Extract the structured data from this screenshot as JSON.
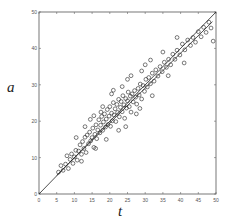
{
  "chart_data": {
    "type": "scatter",
    "title": "",
    "xlabel": "t",
    "ylabel": "a",
    "xlim": [
      0,
      50
    ],
    "ylim": [
      0,
      50
    ],
    "xticks": [
      0,
      5,
      10,
      15,
      20,
      25,
      30,
      35,
      40,
      45,
      50
    ],
    "yticks": [
      0,
      10,
      20,
      30,
      40,
      50
    ],
    "grid": false,
    "legend": null,
    "marker": "open-circle",
    "lines": [
      {
        "name": "identity",
        "slope": 1.0,
        "intercept": 0.0,
        "x": [
          0,
          50
        ]
      },
      {
        "name": "fit",
        "slope": 0.96,
        "intercept": 0.3,
        "x": [
          5,
          49
        ]
      }
    ],
    "series": [
      {
        "name": "samples",
        "points": [
          [
            5.5,
            6.0
          ],
          [
            6.2,
            7.8
          ],
          [
            6.8,
            6.5
          ],
          [
            7.5,
            8.2
          ],
          [
            7.9,
            10.5
          ],
          [
            8.3,
            7.0
          ],
          [
            8.8,
            9.5
          ],
          [
            9.2,
            11.0
          ],
          [
            9.6,
            8.4
          ],
          [
            10.0,
            10.2
          ],
          [
            10.4,
            12.0
          ],
          [
            10.8,
            9.3
          ],
          [
            11.2,
            11.8
          ],
          [
            11.6,
            13.5
          ],
          [
            12.0,
            10.9
          ],
          [
            12.3,
            14.4
          ],
          [
            12.7,
            12.5
          ],
          [
            13.0,
            15.6
          ],
          [
            13.3,
            11.4
          ],
          [
            13.6,
            16.2
          ],
          [
            14.0,
            13.8
          ],
          [
            14.3,
            17.0
          ],
          [
            14.6,
            14.6
          ],
          [
            15.0,
            15.5
          ],
          [
            15.2,
            18.1
          ],
          [
            15.5,
            12.8
          ],
          [
            15.8,
            16.4
          ],
          [
            16.1,
            19.0
          ],
          [
            16.3,
            15.2
          ],
          [
            16.6,
            17.6
          ],
          [
            16.9,
            20.4
          ],
          [
            17.2,
            16.8
          ],
          [
            17.4,
            18.9
          ],
          [
            17.7,
            21.3
          ],
          [
            18.0,
            17.5
          ],
          [
            18.2,
            19.8
          ],
          [
            18.5,
            22.0
          ],
          [
            18.8,
            18.4
          ],
          [
            19.0,
            20.6
          ],
          [
            19.3,
            23.2
          ],
          [
            19.5,
            19.1
          ],
          [
            19.8,
            21.4
          ],
          [
            20.0,
            24.0
          ],
          [
            20.2,
            18.6
          ],
          [
            20.5,
            22.2
          ],
          [
            20.7,
            20.1
          ],
          [
            21.0,
            25.1
          ],
          [
            21.2,
            21.7
          ],
          [
            21.5,
            23.4
          ],
          [
            21.7,
            19.9
          ],
          [
            22.0,
            24.6
          ],
          [
            22.2,
            22.4
          ],
          [
            22.5,
            26.0
          ],
          [
            22.7,
            21.2
          ],
          [
            23.0,
            23.8
          ],
          [
            23.2,
            25.4
          ],
          [
            23.5,
            22.6
          ],
          [
            23.7,
            27.0
          ],
          [
            24.0,
            24.5
          ],
          [
            24.2,
            20.8
          ],
          [
            24.5,
            26.2
          ],
          [
            24.7,
            23.6
          ],
          [
            25.0,
            25.6
          ],
          [
            25.2,
            28.0
          ],
          [
            25.5,
            24.0
          ],
          [
            25.8,
            26.9
          ],
          [
            26.0,
            22.5
          ],
          [
            26.3,
            27.5
          ],
          [
            26.6,
            25.3
          ],
          [
            27.0,
            28.4
          ],
          [
            27.3,
            26.6
          ],
          [
            27.6,
            24.7
          ],
          [
            28.0,
            29.0
          ],
          [
            28.3,
            27.2
          ],
          [
            28.6,
            30.2
          ],
          [
            29.0,
            26.1
          ],
          [
            29.4,
            29.8
          ],
          [
            29.8,
            28.2
          ],
          [
            30.2,
            31.5
          ],
          [
            30.6,
            29.4
          ],
          [
            31.0,
            32.0
          ],
          [
            31.5,
            30.3
          ],
          [
            32.0,
            33.2
          ],
          [
            32.5,
            31.0
          ],
          [
            33.0,
            34.1
          ],
          [
            33.6,
            32.4
          ],
          [
            34.2,
            35.0
          ],
          [
            34.8,
            33.6
          ],
          [
            35.4,
            36.2
          ],
          [
            36.0,
            34.8
          ],
          [
            36.6,
            37.0
          ],
          [
            37.2,
            35.5
          ],
          [
            37.8,
            38.4
          ],
          [
            38.4,
            37.0
          ],
          [
            39.0,
            39.5
          ],
          [
            39.8,
            38.2
          ],
          [
            40.5,
            41.2
          ],
          [
            41.2,
            39.6
          ],
          [
            42.0,
            42.3
          ],
          [
            42.8,
            40.8
          ],
          [
            43.5,
            43.0
          ],
          [
            44.2,
            41.7
          ],
          [
            45.0,
            44.6
          ],
          [
            45.8,
            43.2
          ],
          [
            46.5,
            45.8
          ],
          [
            47.2,
            44.4
          ],
          [
            48.0,
            47.2
          ],
          [
            48.6,
            45.6
          ],
          [
            49.2,
            42.0
          ],
          [
            10.5,
            15.5
          ],
          [
            12.0,
            9.0
          ],
          [
            14.5,
            20.5
          ],
          [
            16.0,
            12.5
          ],
          [
            17.5,
            22.5
          ],
          [
            19.0,
            15.0
          ],
          [
            20.5,
            27.5
          ],
          [
            22.5,
            17.5
          ],
          [
            25.0,
            31.5
          ],
          [
            27.5,
            22.0
          ],
          [
            30.0,
            35.5
          ],
          [
            32.0,
            27.0
          ],
          [
            35.0,
            39.0
          ],
          [
            36.5,
            32.5
          ],
          [
            39.0,
            43.0
          ],
          [
            41.0,
            36.0
          ],
          [
            13.0,
            18.5
          ],
          [
            15.5,
            21.5
          ],
          [
            18.0,
            24.0
          ],
          [
            21.0,
            28.5
          ],
          [
            23.5,
            29.5
          ],
          [
            26.0,
            32.5
          ],
          [
            28.5,
            23.5
          ],
          [
            24.5,
            18.5
          ],
          [
            29.0,
            33.8
          ],
          [
            31.5,
            36.8
          ]
        ]
      }
    ]
  }
}
